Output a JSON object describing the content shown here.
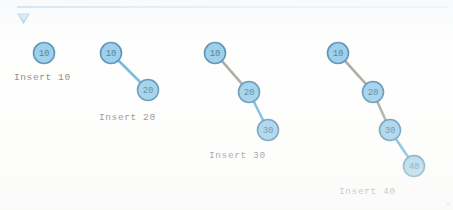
{
  "header": {
    "rule_color": "#5b9dd0",
    "collapse_icon": "triangle-down-icon"
  },
  "theme": {
    "node_fill": "#7cc0e4",
    "node_stroke": "#2a6f9e",
    "node_text": "#17577f",
    "edge_old": "#8d8a82",
    "edge_new": "#3e9fd4",
    "caption_color": "#5c5c5c",
    "background": "#fefefe"
  },
  "chart_data": {
    "type": "diagram",
    "title": "",
    "steps": [
      {
        "caption": "Insert 10",
        "caption_x": 14,
        "caption_y": 72,
        "nodes": [
          {
            "value": "10",
            "x": 44,
            "y": 53,
            "r": 10.5
          }
        ],
        "edges": []
      },
      {
        "caption": "Insert 20",
        "caption_x": 99,
        "caption_y": 112,
        "nodes": [
          {
            "value": "10",
            "x": 111,
            "y": 53,
            "r": 10.5
          },
          {
            "value": "20",
            "x": 148,
            "y": 90,
            "r": 10.5
          }
        ],
        "edges": [
          {
            "from": "10",
            "to": "20",
            "state": "new"
          }
        ]
      },
      {
        "caption": "Insert 30",
        "caption_x": 209,
        "caption_y": 150,
        "nodes": [
          {
            "value": "10",
            "x": 215,
            "y": 53,
            "r": 10.5
          },
          {
            "value": "20",
            "x": 249,
            "y": 92,
            "r": 10.5
          },
          {
            "value": "30",
            "x": 268,
            "y": 130,
            "r": 10.5
          }
        ],
        "edges": [
          {
            "from": "10",
            "to": "20",
            "state": "old"
          },
          {
            "from": "20",
            "to": "30",
            "state": "new"
          }
        ]
      },
      {
        "caption": "Insert 40",
        "caption_x": 339,
        "caption_y": 186,
        "nodes": [
          {
            "value": "10",
            "x": 338,
            "y": 53,
            "r": 10.5
          },
          {
            "value": "20",
            "x": 373,
            "y": 92,
            "r": 10.5
          },
          {
            "value": "30",
            "x": 390,
            "y": 130,
            "r": 10.5
          },
          {
            "value": "40",
            "x": 414,
            "y": 166,
            "r": 10.5
          }
        ],
        "edges": [
          {
            "from": "10",
            "to": "20",
            "state": "old"
          },
          {
            "from": "20",
            "to": "30",
            "state": "old"
          },
          {
            "from": "30",
            "to": "40",
            "state": "new"
          }
        ]
      }
    ]
  }
}
